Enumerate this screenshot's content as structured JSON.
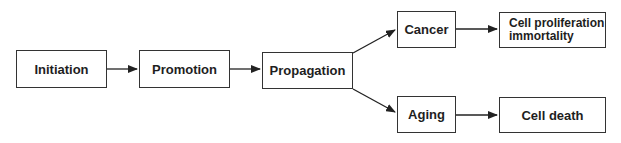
{
  "diagram": {
    "type": "flowchart",
    "nodes": [
      {
        "id": "initiation",
        "label": "Initiation"
      },
      {
        "id": "promotion",
        "label": "Promotion"
      },
      {
        "id": "propagation",
        "label": "Propagation"
      },
      {
        "id": "cancer",
        "label": "Cancer"
      },
      {
        "id": "aging",
        "label": "Aging"
      },
      {
        "id": "cell_proliferation",
        "label": "Cell proliferation\nimmortality"
      },
      {
        "id": "cell_death",
        "label": "Cell death"
      }
    ],
    "edges": [
      {
        "from": "initiation",
        "to": "promotion"
      },
      {
        "from": "promotion",
        "to": "propagation"
      },
      {
        "from": "propagation",
        "to": "cancer"
      },
      {
        "from": "propagation",
        "to": "aging"
      },
      {
        "from": "cancer",
        "to": "cell_proliferation"
      },
      {
        "from": "aging",
        "to": "cell_death"
      }
    ],
    "colors": {
      "stroke": "#333333",
      "text": "#1e1e1e",
      "background": "#ffffff"
    }
  }
}
